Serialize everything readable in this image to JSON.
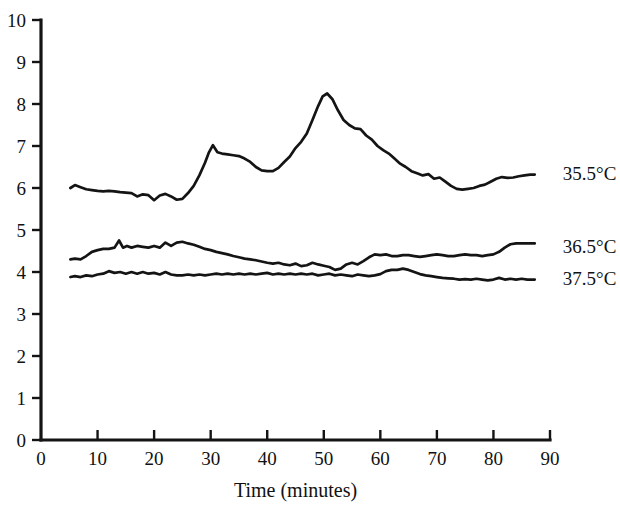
{
  "chart_data": {
    "type": "line",
    "title": "",
    "subtitle": "",
    "xlabel": "Time (minutes)",
    "ylabel": "",
    "xlim": [
      0,
      90
    ],
    "ylim": [
      0,
      10
    ],
    "xticks": [
      0,
      10,
      20,
      30,
      40,
      50,
      60,
      70,
      80,
      90
    ],
    "yticks": [
      0,
      1,
      2,
      3,
      4,
      5,
      6,
      7,
      8,
      9,
      10
    ],
    "xtick_labels": [
      "0",
      "10",
      "20",
      "30",
      "40",
      "50",
      "60",
      "70",
      "80",
      "90"
    ],
    "ytick_labels": [
      "0",
      "1",
      "2",
      "3",
      "4",
      "5",
      "6",
      "7",
      "8",
      "9",
      "10"
    ],
    "grid": false,
    "legend_position": "right-of-curve-ends",
    "line_color": "#141414",
    "series": [
      {
        "name": "35.5°C",
        "label_x": 90.5,
        "label_y": 6.35,
        "x": [
          5.2,
          6.0,
          7.0,
          8.0,
          9.0,
          10.0,
          11.0,
          12.0,
          13.0,
          14.0,
          15.0,
          16.0,
          17.0,
          18.0,
          19.0,
          20.0,
          21.0,
          22.0,
          23.0,
          24.0,
          25.0,
          26.0,
          27.0,
          28.0,
          29.0,
          29.7,
          30.4,
          31.2,
          32.0,
          33.0,
          34.0,
          35.0,
          36.0,
          37.0,
          38.0,
          39.0,
          40.0,
          41.0,
          42.0,
          43.0,
          44.0,
          45.0,
          46.0,
          47.0,
          48.0,
          49.0,
          49.8,
          50.6,
          51.5,
          52.5,
          53.5,
          54.5,
          55.5,
          56.5,
          57.5,
          58.5,
          59.5,
          60.5,
          61.5,
          62.5,
          63.5,
          64.5,
          65.5,
          66.5,
          67.5,
          68.5,
          69.5,
          70.5,
          71.5,
          72.5,
          73.5,
          74.5,
          75.5,
          76.5,
          77.5,
          78.5,
          79.5,
          80.5,
          81.5,
          82.5,
          83.5,
          84.5,
          85.5,
          86.5,
          87.3
        ],
        "y": [
          6.0,
          6.07,
          6.02,
          5.97,
          5.95,
          5.93,
          5.92,
          5.93,
          5.92,
          5.9,
          5.89,
          5.88,
          5.8,
          5.85,
          5.83,
          5.71,
          5.82,
          5.86,
          5.8,
          5.72,
          5.74,
          5.88,
          6.05,
          6.3,
          6.6,
          6.85,
          7.02,
          6.85,
          6.82,
          6.8,
          6.78,
          6.76,
          6.7,
          6.62,
          6.5,
          6.42,
          6.4,
          6.4,
          6.48,
          6.62,
          6.75,
          6.95,
          7.1,
          7.3,
          7.62,
          7.95,
          8.18,
          8.25,
          8.12,
          7.85,
          7.62,
          7.5,
          7.42,
          7.4,
          7.25,
          7.15,
          7.0,
          6.9,
          6.82,
          6.7,
          6.58,
          6.5,
          6.4,
          6.35,
          6.3,
          6.33,
          6.22,
          6.25,
          6.15,
          6.05,
          5.98,
          5.96,
          5.98,
          6.0,
          6.05,
          6.08,
          6.15,
          6.22,
          6.26,
          6.24,
          6.25,
          6.28,
          6.3,
          6.32,
          6.32
        ]
      },
      {
        "name": "36.5°C",
        "label_x": 90.5,
        "label_y": 4.62,
        "x": [
          5.2,
          6.0,
          7.0,
          8.0,
          9.0,
          10.0,
          11.0,
          12.0,
          13.0,
          13.8,
          14.5,
          15.2,
          16.0,
          17.0,
          18.0,
          19.0,
          20.0,
          21.0,
          22.0,
          23.0,
          24.0,
          25.0,
          26.0,
          27.0,
          28.0,
          29.0,
          30.0,
          31.0,
          32.0,
          33.0,
          34.0,
          35.0,
          36.0,
          37.0,
          38.0,
          39.0,
          40.0,
          41.0,
          42.0,
          43.0,
          44.0,
          45.0,
          46.0,
          47.0,
          48.0,
          49.0,
          50.0,
          51.0,
          52.0,
          53.0,
          54.0,
          55.0,
          56.0,
          57.0,
          58.0,
          59.0,
          60.0,
          61.0,
          62.0,
          63.0,
          64.0,
          65.0,
          66.0,
          67.0,
          68.0,
          69.0,
          70.0,
          71.0,
          72.0,
          73.0,
          74.0,
          75.0,
          76.0,
          77.0,
          78.0,
          79.0,
          80.0,
          81.0,
          82.0,
          83.0,
          84.0,
          85.0,
          86.0,
          87.3
        ],
        "y": [
          4.3,
          4.32,
          4.3,
          4.38,
          4.48,
          4.52,
          4.55,
          4.55,
          4.58,
          4.75,
          4.58,
          4.62,
          4.58,
          4.62,
          4.6,
          4.58,
          4.62,
          4.58,
          4.7,
          4.62,
          4.7,
          4.72,
          4.68,
          4.65,
          4.6,
          4.55,
          4.52,
          4.48,
          4.45,
          4.42,
          4.38,
          4.35,
          4.32,
          4.3,
          4.28,
          4.25,
          4.22,
          4.2,
          4.22,
          4.18,
          4.16,
          4.2,
          4.14,
          4.16,
          4.22,
          4.18,
          4.15,
          4.12,
          4.05,
          4.08,
          4.18,
          4.22,
          4.18,
          4.26,
          4.35,
          4.42,
          4.4,
          4.42,
          4.38,
          4.38,
          4.4,
          4.4,
          4.38,
          4.36,
          4.38,
          4.4,
          4.42,
          4.4,
          4.38,
          4.38,
          4.4,
          4.42,
          4.4,
          4.4,
          4.38,
          4.4,
          4.42,
          4.48,
          4.58,
          4.66,
          4.68,
          4.68,
          4.68,
          4.68
        ]
      },
      {
        "name": "37.5°C",
        "label_x": 90.5,
        "label_y": 3.85,
        "x": [
          5.2,
          6.0,
          7.0,
          8.0,
          9.0,
          10.0,
          11.0,
          12.0,
          13.0,
          14.0,
          15.0,
          16.0,
          17.0,
          18.0,
          19.0,
          20.0,
          21.0,
          22.0,
          23.0,
          24.0,
          25.0,
          26.0,
          27.0,
          28.0,
          29.0,
          30.0,
          31.0,
          32.0,
          33.0,
          34.0,
          35.0,
          36.0,
          37.0,
          38.0,
          39.0,
          40.0,
          41.0,
          42.0,
          43.0,
          44.0,
          45.0,
          46.0,
          47.0,
          48.0,
          49.0,
          50.0,
          51.0,
          52.0,
          53.0,
          54.0,
          55.0,
          56.0,
          57.0,
          58.0,
          59.0,
          60.0,
          61.0,
          62.0,
          63.0,
          64.0,
          65.0,
          66.0,
          67.0,
          68.0,
          69.0,
          70.0,
          71.0,
          72.0,
          73.0,
          74.0,
          75.0,
          76.0,
          77.0,
          78.0,
          79.0,
          80.0,
          81.0,
          82.0,
          83.0,
          84.0,
          85.0,
          86.0,
          87.3
        ],
        "y": [
          3.88,
          3.9,
          3.88,
          3.92,
          3.9,
          3.94,
          3.96,
          4.02,
          3.98,
          4.0,
          3.96,
          4.0,
          3.96,
          4.0,
          3.96,
          3.98,
          3.94,
          4.0,
          3.94,
          3.92,
          3.92,
          3.94,
          3.92,
          3.94,
          3.92,
          3.94,
          3.96,
          3.94,
          3.96,
          3.94,
          3.96,
          3.94,
          3.96,
          3.94,
          3.96,
          3.98,
          3.94,
          3.96,
          3.94,
          3.96,
          3.94,
          3.96,
          3.94,
          3.96,
          3.92,
          3.94,
          3.96,
          3.92,
          3.94,
          3.92,
          3.9,
          3.94,
          3.92,
          3.9,
          3.92,
          3.95,
          4.02,
          4.05,
          4.05,
          4.08,
          4.05,
          4.0,
          3.95,
          3.92,
          3.9,
          3.88,
          3.86,
          3.85,
          3.84,
          3.82,
          3.83,
          3.82,
          3.84,
          3.82,
          3.8,
          3.82,
          3.86,
          3.82,
          3.84,
          3.82,
          3.84,
          3.82,
          3.82
        ]
      }
    ]
  }
}
